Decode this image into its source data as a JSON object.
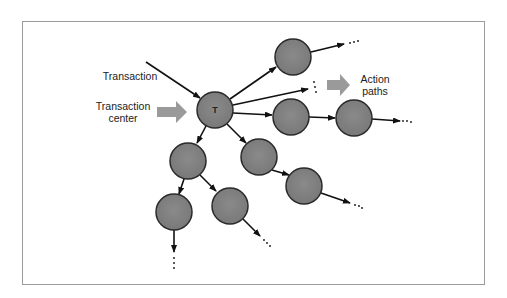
{
  "diagram": {
    "labels": {
      "transaction": "Transaction",
      "transaction_center_line1": "Transaction",
      "transaction_center_line2": "center",
      "action_paths_line1": "Action",
      "action_paths_line2": "paths",
      "center_node": "T"
    },
    "colors": {
      "node_fill": "#7f7f7f",
      "node_stroke": "#2a2a2a",
      "edge": "#111111",
      "block_arrow": "#9a9a9a",
      "frame": "#9a9a9a"
    },
    "nodes": [
      {
        "id": "T",
        "x": 215,
        "y": 110,
        "r": 18
      },
      {
        "id": "n1",
        "x": 293,
        "y": 57,
        "r": 18
      },
      {
        "id": "n2",
        "x": 291,
        "y": 117,
        "r": 18
      },
      {
        "id": "n3",
        "x": 354,
        "y": 118,
        "r": 18
      },
      {
        "id": "n4",
        "x": 188,
        "y": 161,
        "r": 18
      },
      {
        "id": "n5",
        "x": 259,
        "y": 157,
        "r": 18
      },
      {
        "id": "n6",
        "x": 304,
        "y": 186,
        "r": 18
      },
      {
        "id": "n7",
        "x": 174,
        "y": 212,
        "r": 18
      },
      {
        "id": "n8",
        "x": 230,
        "y": 206,
        "r": 18
      }
    ],
    "ellipsis": "..."
  }
}
